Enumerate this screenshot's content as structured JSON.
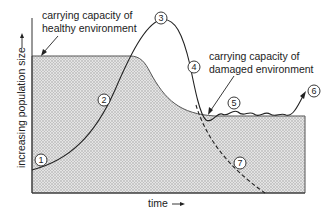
{
  "diagram": {
    "labels": {
      "healthy_line1": "carrying capacity of",
      "healthy_line2": "healthy environment",
      "damaged_line1": "carrying capacity of",
      "damaged_line2": "damaged environment",
      "y_axis": "increasing population size",
      "x_axis": "time"
    },
    "markers": [
      {
        "id": "1",
        "label": "1"
      },
      {
        "id": "2",
        "label": "2"
      },
      {
        "id": "3",
        "label": "3"
      },
      {
        "id": "4",
        "label": "4"
      },
      {
        "id": "5",
        "label": "5"
      },
      {
        "id": "6",
        "label": "6"
      },
      {
        "id": "7",
        "label": "7"
      }
    ],
    "colors": {
      "line": "#222222",
      "shade": "#b8b8b8",
      "background": "#ffffff"
    }
  }
}
